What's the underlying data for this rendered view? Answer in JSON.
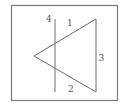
{
  "diagram": {
    "segments": [
      {
        "id": "1",
        "label": "1",
        "role": "upper-left side of triangle"
      },
      {
        "id": "2",
        "label": "2",
        "role": "lower-left side of triangle"
      },
      {
        "id": "3",
        "label": "3",
        "role": "right vertical side of triangle"
      },
      {
        "id": "4",
        "label": "4",
        "role": "vertical line crossing the triangle"
      }
    ]
  },
  "colors": {
    "line": "#6e6e6e",
    "frame": "#7a7a7a",
    "text": "#555555",
    "background": "#ffffff"
  }
}
